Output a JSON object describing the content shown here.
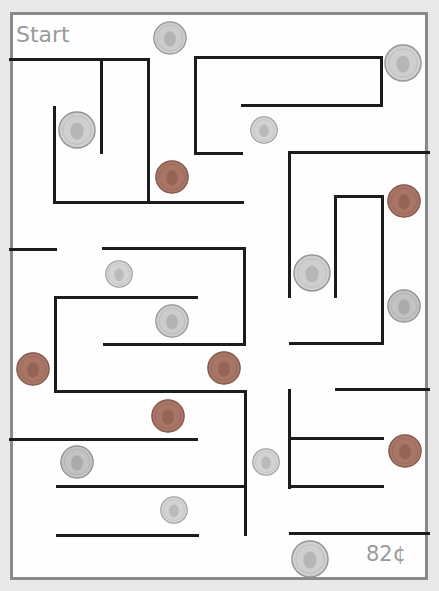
{
  "labels": {
    "start": "Start",
    "total": "82¢"
  },
  "colors": {
    "border": "#8a8a8a",
    "wall": "#1c1c1c",
    "silver": "#c9c9c9",
    "copper": "#a46f64",
    "text": "#9a9a9a"
  },
  "walls": [
    {
      "x1": 10,
      "y1": 59,
      "x2": 148,
      "y2": 59
    },
    {
      "x1": 101,
      "y1": 59,
      "x2": 101,
      "y2": 152
    },
    {
      "x1": 148,
      "y1": 59,
      "x2": 148,
      "y2": 202
    },
    {
      "x1": 54,
      "y1": 107,
      "x2": 54,
      "y2": 202
    },
    {
      "x1": 54,
      "y1": 202,
      "x2": 242,
      "y2": 202
    },
    {
      "x1": 195,
      "y1": 57,
      "x2": 381,
      "y2": 57
    },
    {
      "x1": 195,
      "y1": 57,
      "x2": 195,
      "y2": 153
    },
    {
      "x1": 195,
      "y1": 153,
      "x2": 241,
      "y2": 153
    },
    {
      "x1": 242,
      "y1": 105,
      "x2": 381,
      "y2": 105
    },
    {
      "x1": 381,
      "y1": 57,
      "x2": 381,
      "y2": 105
    },
    {
      "x1": 289,
      "y1": 152,
      "x2": 428,
      "y2": 152
    },
    {
      "x1": 289,
      "y1": 152,
      "x2": 289,
      "y2": 296
    },
    {
      "x1": 335,
      "y1": 196,
      "x2": 382,
      "y2": 196
    },
    {
      "x1": 335,
      "y1": 196,
      "x2": 335,
      "y2": 296
    },
    {
      "x1": 382,
      "y1": 196,
      "x2": 382,
      "y2": 343
    },
    {
      "x1": 290,
      "y1": 343,
      "x2": 382,
      "y2": 343
    },
    {
      "x1": 10,
      "y1": 249,
      "x2": 55,
      "y2": 249
    },
    {
      "x1": 103,
      "y1": 248,
      "x2": 244,
      "y2": 248
    },
    {
      "x1": 244,
      "y1": 248,
      "x2": 244,
      "y2": 344
    },
    {
      "x1": 104,
      "y1": 344,
      "x2": 244,
      "y2": 344
    },
    {
      "x1": 55,
      "y1": 297,
      "x2": 196,
      "y2": 297
    },
    {
      "x1": 55,
      "y1": 297,
      "x2": 55,
      "y2": 391
    },
    {
      "x1": 55,
      "y1": 391,
      "x2": 245,
      "y2": 391
    },
    {
      "x1": 245,
      "y1": 391,
      "x2": 245,
      "y2": 534
    },
    {
      "x1": 10,
      "y1": 439,
      "x2": 196,
      "y2": 439
    },
    {
      "x1": 57,
      "y1": 486,
      "x2": 245,
      "y2": 486
    },
    {
      "x1": 57,
      "y1": 535,
      "x2": 197,
      "y2": 535
    },
    {
      "x1": 336,
      "y1": 389,
      "x2": 428,
      "y2": 389
    },
    {
      "x1": 289,
      "y1": 390,
      "x2": 289,
      "y2": 487
    },
    {
      "x1": 289,
      "y1": 438,
      "x2": 382,
      "y2": 438
    },
    {
      "x1": 289,
      "y1": 486,
      "x2": 382,
      "y2": 486
    },
    {
      "x1": 290,
      "y1": 533,
      "x2": 428,
      "y2": 533
    }
  ],
  "coins": [
    {
      "type": "half-dollar",
      "value": "50¢",
      "cx": 170,
      "cy": 38,
      "r": 17
    },
    {
      "type": "quarter",
      "value": "25¢",
      "cx": 403,
      "cy": 63,
      "r": 19
    },
    {
      "type": "quarter",
      "value": "25¢",
      "cx": 77,
      "cy": 130,
      "r": 19
    },
    {
      "type": "dime",
      "value": "10¢",
      "cx": 264,
      "cy": 130,
      "r": 14
    },
    {
      "type": "penny",
      "value": "1¢",
      "cx": 172,
      "cy": 177,
      "r": 17
    },
    {
      "type": "penny",
      "value": "1¢",
      "cx": 404,
      "cy": 201,
      "r": 17
    },
    {
      "type": "quarter",
      "value": "25¢",
      "cx": 312,
      "cy": 273,
      "r": 19
    },
    {
      "type": "dime",
      "value": "10¢",
      "cx": 119,
      "cy": 274,
      "r": 14
    },
    {
      "type": "nickel",
      "value": "5¢",
      "cx": 404,
      "cy": 306,
      "r": 17
    },
    {
      "type": "half-dollar",
      "value": "50¢",
      "cx": 172,
      "cy": 321,
      "r": 17
    },
    {
      "type": "penny",
      "value": "1¢",
      "cx": 33,
      "cy": 369,
      "r": 17
    },
    {
      "type": "penny",
      "value": "1¢",
      "cx": 224,
      "cy": 368,
      "r": 17
    },
    {
      "type": "penny",
      "value": "1¢",
      "cx": 168,
      "cy": 416,
      "r": 17
    },
    {
      "type": "penny",
      "value": "1¢",
      "cx": 405,
      "cy": 451,
      "r": 17
    },
    {
      "type": "dime",
      "value": "10¢",
      "cx": 266,
      "cy": 462,
      "r": 14
    },
    {
      "type": "nickel",
      "value": "5¢",
      "cx": 77,
      "cy": 462,
      "r": 17
    },
    {
      "type": "dime",
      "value": "10¢",
      "cx": 174,
      "cy": 510,
      "r": 14
    },
    {
      "type": "quarter",
      "value": "25¢",
      "cx": 310,
      "cy": 559,
      "r": 19
    }
  ]
}
